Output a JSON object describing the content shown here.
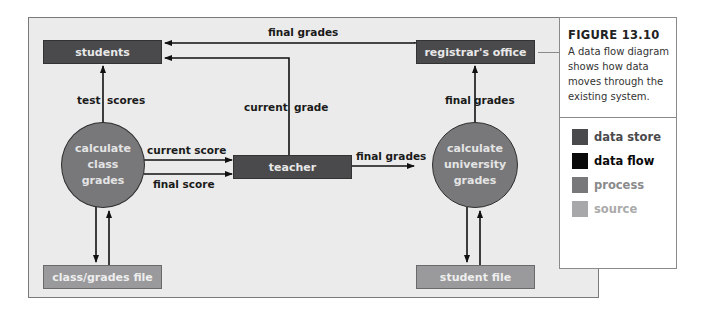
{
  "figure": {
    "label": "FIGURE 13.10",
    "caption": "A data flow diagram shows how data moves through the existing system."
  },
  "nodes": {
    "students": "students",
    "registrar": "registrar's office",
    "teacher": "teacher",
    "calc_class": [
      "calculate",
      "class",
      "grades"
    ],
    "calc_univ": [
      "calculate",
      "university",
      "grades"
    ],
    "class_file": "class/grades file",
    "student_file": "student file"
  },
  "flows": {
    "final_grades_top": "final grades",
    "test_scores_left": "test",
    "test_scores_right": "scores",
    "current_grade_left": "current",
    "current_grade_right": "grade",
    "final_grades_right_left": "final",
    "final_grades_right_right": "grades",
    "current_score": "current score",
    "final_score": "final score",
    "final_grades_mid": "final grades"
  },
  "legend": [
    {
      "label": "data store",
      "color": "#4a4a4c",
      "text_color": "#4a4a4c"
    },
    {
      "label": "data flow",
      "color": "#0a0a0a",
      "text_color": "#0a0a0a"
    },
    {
      "label": "process",
      "color": "#78787a",
      "text_color": "#8a8a8a"
    },
    {
      "label": "source",
      "color": "#a8a8aa",
      "text_color": "#aaaaaa"
    }
  ]
}
